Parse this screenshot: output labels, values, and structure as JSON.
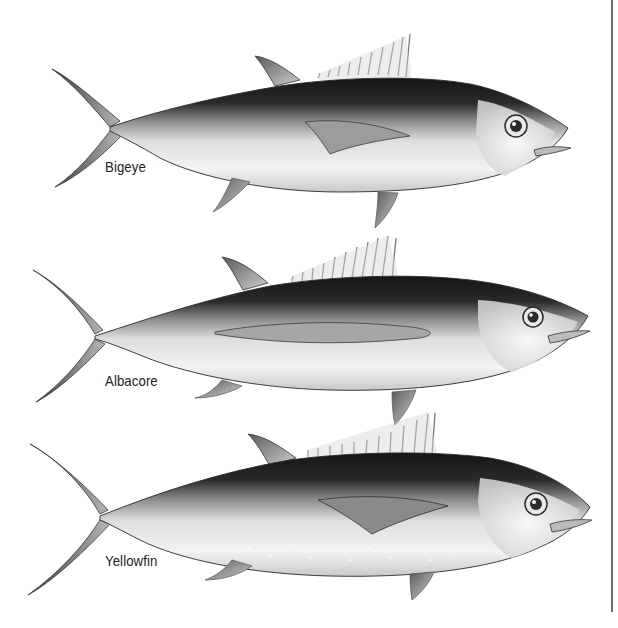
{
  "figure": {
    "title": "",
    "species": [
      {
        "id": "bigeye",
        "label": "Bigeye"
      },
      {
        "id": "albacore",
        "label": "Albacore"
      },
      {
        "id": "yellowfin",
        "label": "Yellowfin"
      }
    ]
  },
  "colors": {
    "background": "#ffffff",
    "dorsal_dark": "#1e1e1e",
    "body_mid": "#9a9a9a",
    "belly_light": "#f2f2f2",
    "fin_grey": "#8c8c8c",
    "label_text": "#222222",
    "frame_line": "#6f6f6f"
  }
}
